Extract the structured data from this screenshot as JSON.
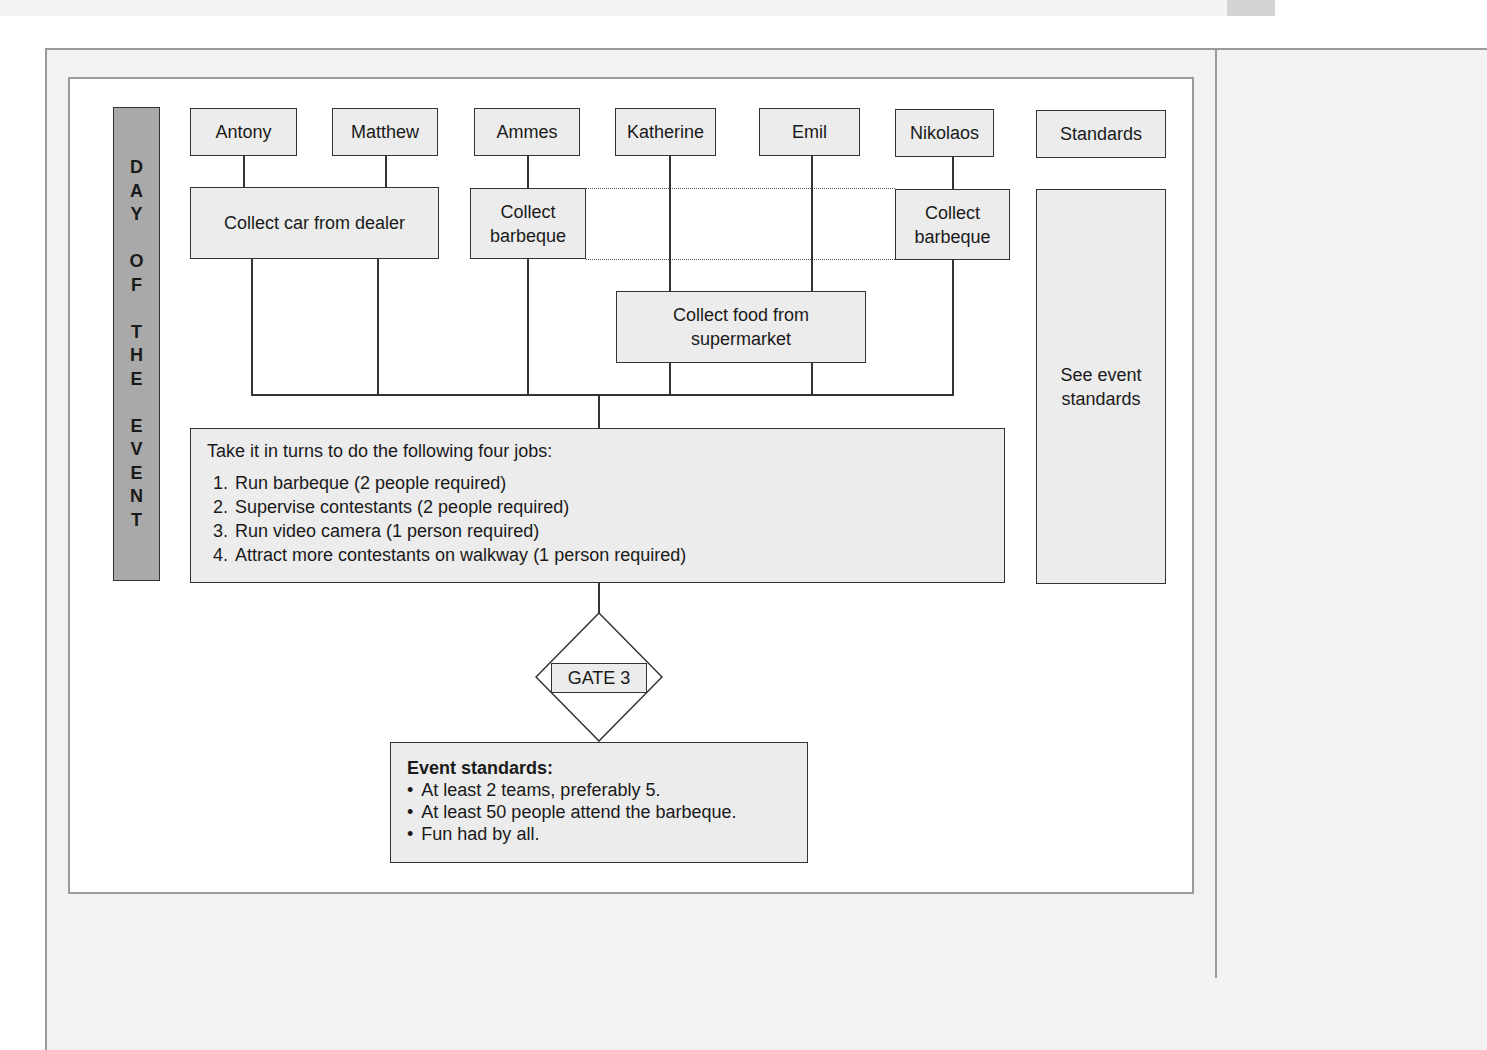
{
  "diagram": {
    "sidebar_label": [
      "D",
      "A",
      "Y",
      "",
      "O",
      "F",
      "",
      "T",
      "H",
      "E",
      "",
      "E",
      "V",
      "E",
      "N",
      "T"
    ],
    "people": [
      {
        "name": "Antony"
      },
      {
        "name": "Matthew"
      },
      {
        "name": "Ammes"
      },
      {
        "name": "Katherine"
      },
      {
        "name": "Emil"
      },
      {
        "name": "Nikolaos"
      }
    ],
    "standards_header": "Standards",
    "tasks": {
      "collect_car": "Collect car from dealer",
      "collect_bbq_left": "Collect barbeque",
      "collect_bbq_right": "Collect barbeque",
      "collect_food": "Collect food from supermarket"
    },
    "see_standards": "See event standards",
    "jobs": {
      "intro": "Take it in turns to do the following four jobs:",
      "items": [
        "Run barbeque (2 people required)",
        "Supervise contestants (2 people required)",
        "Run video camera (1 person required)",
        "Attract more contestants on walkway (1 person required)"
      ]
    },
    "gate": {
      "label": "GATE 3"
    },
    "event_standards": {
      "title": "Event standards:",
      "items": [
        "At least 2 teams, preferably 5.",
        "At least 50 people attend the barbeque.",
        "Fun had by all."
      ]
    }
  },
  "colors": {
    "box_fill": "#ececec",
    "sidebar_fill": "#a9a9a9",
    "frame_gray": "#9a9a9a",
    "line": "#333333"
  }
}
